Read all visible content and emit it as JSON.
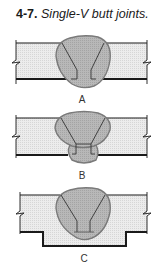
{
  "caption": {
    "number": "4-7.",
    "text": "Single-V butt joints."
  },
  "diagrams": [
    {
      "label": "A",
      "description": "Single-V butt joint, weld bead only"
    },
    {
      "label": "B",
      "description": "Single-V butt joint with back weld"
    },
    {
      "label": "C",
      "description": "Single-V butt joint with backing strip"
    }
  ],
  "colors": {
    "plate_fill": "#e8e8e8",
    "weld_fill": "#b4b4b4",
    "weld_outline": "#7a7a7a",
    "line": "#1a1a1a"
  }
}
